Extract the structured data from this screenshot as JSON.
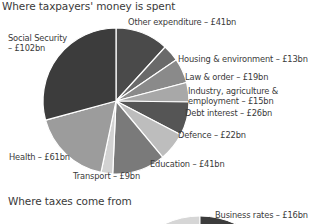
{
  "chart_data": [
    {
      "type": "pie",
      "title": "Where taxpayers' money is spent",
      "units": "£bn",
      "start_angle": "12 o'clock",
      "direction": "clockwise",
      "categories": [
        "Other expenditure",
        "Housing & environment",
        "Law & order",
        "Industry, agriculture & employment",
        "Debt interest",
        "Defence",
        "Education",
        "Transport",
        "Health",
        "Social Security"
      ],
      "values": [
        41,
        13,
        19,
        15,
        26,
        22,
        41,
        9,
        61,
        102
      ],
      "colors": [
        "#4a4a4a",
        "#6a6a6a",
        "#8a8a8a",
        "#a8a8a8",
        "#555555",
        "#bdbdbd",
        "#7a7a7a",
        "#d2d2d2",
        "#9c9c9c",
        "#3c3c3c"
      ],
      "labels": [
        "Other expenditure – £41bn",
        "Housing & environment – £13bn",
        "Law & order – £19bn",
        "Industry, agriculture &",
        "employment – £15bn",
        "Debt interest – £26bn",
        "Defence – £22bn",
        "Education – £41bn",
        "Transport – £9bn",
        "Health – £61bn",
        "Social Security",
        "– £102bn"
      ]
    },
    {
      "type": "pie",
      "title": "Where taxes come from",
      "units": "£bn",
      "partial": true,
      "categories": [
        "Business rates"
      ],
      "values": [
        16
      ],
      "labels": [
        "Business rates – £16bn"
      ]
    }
  ]
}
